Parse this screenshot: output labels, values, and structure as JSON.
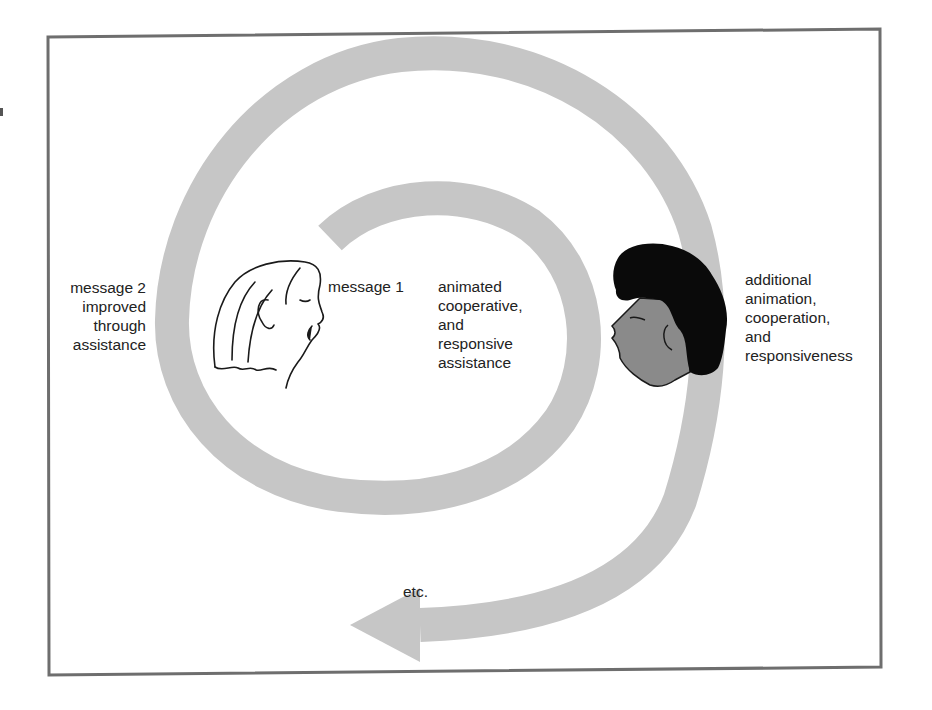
{
  "colors": {
    "spiral": "#c6c6c6",
    "border": "#6e6e6e",
    "text": "#222222",
    "hair_dark": "#0a0a0a",
    "skin_dark": "#8a8a8a",
    "line": "#1a1a1a"
  },
  "labels": {
    "message2": [
      "message 2",
      "improved",
      "through",
      "assistance"
    ],
    "message1": "message 1",
    "assistance": [
      "animated",
      "cooperative,",
      "and",
      "responsive",
      "assistance"
    ],
    "additional": [
      "additional",
      "animation,",
      "cooperation,",
      "and",
      "responsiveness"
    ],
    "etc": "etc."
  },
  "figures": {
    "speaker": "woman-profile-outline",
    "listener": "person-profile-dark-hair"
  },
  "spiral": {
    "direction": "clockwise-outward",
    "ends_with": "arrowhead-left"
  }
}
